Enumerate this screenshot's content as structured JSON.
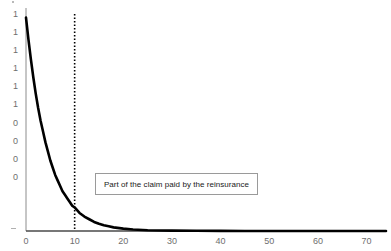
{
  "chart_data": {
    "type": "line",
    "title": "",
    "xlabel": "",
    "ylabel": "",
    "xlim": [
      0,
      74
    ],
    "ylim": [
      0,
      1.2
    ],
    "grid": false,
    "legend": null,
    "x_ticks": [
      "0",
      "10",
      "20",
      "30",
      "40",
      "50",
      "60",
      "70"
    ],
    "x_tick_values": [
      0,
      10,
      20,
      30,
      40,
      50,
      60,
      70
    ],
    "y_ticks": [
      "1",
      "1",
      "1",
      "1",
      "1",
      "1",
      "0",
      "0",
      "0",
      "0"
    ],
    "y_tick_values": [
      1.2,
      1.1,
      1.0,
      0.9,
      0.8,
      0.7,
      0.6,
      0.5,
      0.4,
      0.3
    ],
    "series": [
      {
        "name": "claim-density-curve",
        "color": "#000000",
        "x": [
          0,
          0.5,
          1,
          1.5,
          2,
          2.5,
          3,
          3.5,
          4,
          4.5,
          5,
          5.5,
          6,
          6.5,
          7,
          7.5,
          8,
          8.5,
          9,
          9.5,
          10,
          11,
          12,
          13,
          14,
          15,
          16,
          17,
          18,
          20,
          22,
          25,
          30,
          35,
          40,
          45,
          50,
          55,
          60,
          65,
          70,
          74
        ],
        "y": [
          1.18,
          1.06,
          0.95,
          0.85,
          0.76,
          0.68,
          0.61,
          0.55,
          0.49,
          0.44,
          0.39,
          0.35,
          0.31,
          0.28,
          0.25,
          0.22,
          0.2,
          0.18,
          0.16,
          0.14,
          0.13,
          0.1,
          0.08,
          0.065,
          0.05,
          0.04,
          0.032,
          0.026,
          0.02,
          0.013,
          0.008,
          0.004,
          0.002,
          0.001,
          0.0005,
          0.0003,
          0.0002,
          0.0001,
          0.0001,
          0,
          0,
          0
        ]
      }
    ],
    "annotations": [
      {
        "name": "reinsurance-threshold-line",
        "type": "vline",
        "x": 10,
        "style": "dotted",
        "color": "#000000"
      },
      {
        "name": "reinsurance-label-box",
        "type": "textbox",
        "text": "Part of the claim paid by the reinsurance",
        "border_color": "#9a9a9a",
        "background": "#ffffff"
      }
    ]
  },
  "axis": {
    "line_color": "#808080",
    "tick_color": "#6e6e6e"
  }
}
